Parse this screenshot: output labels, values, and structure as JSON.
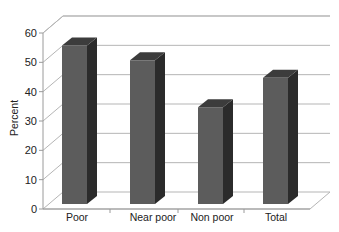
{
  "chart_data": {
    "type": "bar",
    "style": "3d-column",
    "title": "",
    "xlabel": "",
    "ylabel": "Percent",
    "categories": [
      "Poor",
      "Near poor",
      "Non poor",
      "Total"
    ],
    "values": [
      54,
      49,
      33,
      43
    ],
    "ylim": [
      0,
      60
    ],
    "yticks": [
      0,
      10,
      20,
      30,
      40,
      50,
      60
    ],
    "grid": true,
    "legend": null,
    "colors": {
      "bar_front": "#5c5c5c",
      "bar_side": "#2b2b2b",
      "bar_top": "#3c3c3c",
      "grid": "#b5b5b5",
      "axis": "#9a9a9a"
    }
  }
}
